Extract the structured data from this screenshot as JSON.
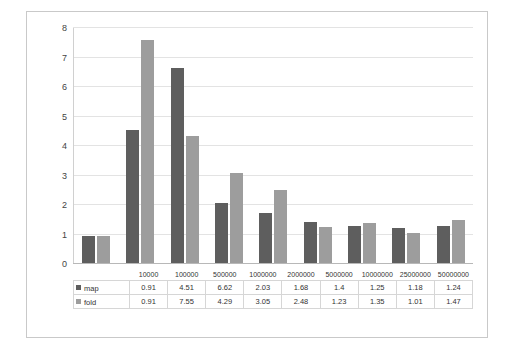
{
  "chart_data": {
    "type": "bar",
    "title": "",
    "xlabel": "",
    "ylabel": "",
    "ylim": [
      0,
      8
    ],
    "yticks": [
      "0",
      "1",
      "2",
      "3",
      "4",
      "5",
      "6",
      "7",
      "8"
    ],
    "grid": true,
    "legend_position": "table-left",
    "categories": [
      "10000",
      "100000",
      "500000",
      "1000000",
      "2000000",
      "5000000",
      "10000000",
      "25000000",
      "50000000"
    ],
    "series": [
      {
        "name": "map",
        "color": "#5e5e5e",
        "values": [
          0.91,
          4.51,
          6.62,
          2.03,
          1.68,
          1.4,
          1.25,
          1.18,
          1.24
        ],
        "labels": [
          "0.91",
          "4.51",
          "6.62",
          "2.03",
          "1.68",
          "1.4",
          "1.25",
          "1.18",
          "1.24"
        ]
      },
      {
        "name": "fold",
        "color": "#9d9d9d",
        "values": [
          0.91,
          7.55,
          4.29,
          3.05,
          2.48,
          1.23,
          1.35,
          1.01,
          1.47
        ],
        "labels": [
          "0.91",
          "7.55",
          "4.29",
          "3.05",
          "2.48",
          "1.23",
          "1.35",
          "1.01",
          "1.47"
        ]
      }
    ]
  }
}
